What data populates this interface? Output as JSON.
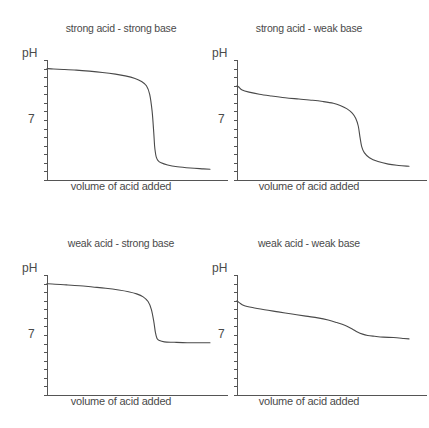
{
  "figure": {
    "background_color": "#ffffff",
    "line_color": "#4a4a4a",
    "axis_color": "#555555",
    "width": 423,
    "height": 428
  },
  "chart_data": [
    {
      "type": "line",
      "title": "strong acid - strong base",
      "xlabel": "volume of acid added",
      "ylabel": "pH",
      "ytick_labels": [
        "7"
      ],
      "ytick_values": [
        7
      ],
      "ylim": [
        0,
        14
      ],
      "xlim": [
        0,
        100
      ],
      "grid": false,
      "legend": "none",
      "n_minor_ticks": 14,
      "series": [
        {
          "name": "titration curve",
          "x": [
            0,
            4,
            10,
            18,
            26,
            34,
            42,
            48,
            54,
            58,
            61,
            63,
            64.5,
            65.5,
            66,
            66.5,
            67,
            68,
            70,
            74,
            80,
            88,
            96,
            100
          ],
          "y": [
            13.0,
            12.95,
            12.9,
            12.82,
            12.7,
            12.55,
            12.35,
            12.15,
            11.85,
            11.5,
            11.0,
            10.0,
            8.0,
            5.5,
            4.0,
            3.2,
            2.7,
            2.3,
            2.0,
            1.75,
            1.55,
            1.4,
            1.3,
            1.25
          ]
        }
      ]
    },
    {
      "type": "line",
      "title": "strong acid - weak base",
      "xlabel": "volume of acid added",
      "ylabel": "pH",
      "ytick_labels": [
        "7"
      ],
      "ytick_values": [
        7
      ],
      "ylim": [
        0,
        14
      ],
      "xlim": [
        0,
        100
      ],
      "grid": false,
      "legend": "none",
      "n_minor_ticks": 14,
      "series": [
        {
          "name": "titration curve",
          "x": [
            0,
            1,
            3,
            7,
            13,
            20,
            28,
            36,
            44,
            50,
            56,
            60,
            64,
            67,
            69,
            70.5,
            71.5,
            72.5,
            74,
            77,
            82,
            88,
            94,
            100
          ],
          "y": [
            11.0,
            10.85,
            10.5,
            10.25,
            10.0,
            9.8,
            9.6,
            9.45,
            9.3,
            9.15,
            8.95,
            8.7,
            8.3,
            7.8,
            7.2,
            6.3,
            5.0,
            3.9,
            3.2,
            2.6,
            2.15,
            1.85,
            1.7,
            1.6
          ]
        }
      ]
    },
    {
      "type": "line",
      "title": "weak acid - strong base",
      "xlabel": "volume of acid added",
      "ylabel": "pH",
      "ytick_labels": [
        "7"
      ],
      "ytick_values": [
        7
      ],
      "ylim": [
        0,
        14
      ],
      "xlim": [
        0,
        100
      ],
      "grid": false,
      "legend": "none",
      "n_minor_ticks": 14,
      "series": [
        {
          "name": "titration curve",
          "x": [
            0,
            5,
            12,
            20,
            28,
            36,
            44,
            50,
            55,
            59,
            62,
            64,
            65.5,
            66.5,
            67.5,
            69,
            72,
            78,
            86,
            94,
            100
          ],
          "y": [
            13.0,
            12.92,
            12.85,
            12.75,
            12.6,
            12.45,
            12.25,
            12.05,
            11.8,
            11.45,
            10.9,
            10.0,
            8.6,
            7.3,
            6.6,
            6.35,
            6.2,
            6.15,
            6.1,
            6.1,
            6.1
          ]
        }
      ]
    },
    {
      "type": "line",
      "title": "weak acid - weak base",
      "xlabel": "volume of acid added",
      "ylabel": "pH",
      "ytick_labels": [
        "7"
      ],
      "ytick_values": [
        7
      ],
      "ylim": [
        0,
        14
      ],
      "xlim": [
        0,
        100
      ],
      "grid": false,
      "legend": "none",
      "n_minor_ticks": 14,
      "series": [
        {
          "name": "titration curve",
          "x": [
            0,
            1.5,
            4,
            9,
            16,
            24,
            32,
            40,
            47,
            53,
            58,
            63,
            67,
            70,
            73,
            76,
            80,
            85,
            91,
            97,
            100
          ],
          "y": [
            11.0,
            10.75,
            10.45,
            10.2,
            9.95,
            9.7,
            9.45,
            9.2,
            9.0,
            8.75,
            8.45,
            8.1,
            7.7,
            7.35,
            7.1,
            6.95,
            6.85,
            6.75,
            6.7,
            6.6,
            6.55
          ]
        }
      ]
    }
  ]
}
